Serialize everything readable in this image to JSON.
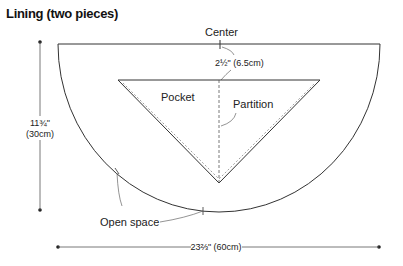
{
  "title": "Lining (two pieces)",
  "labels": {
    "center": "Center",
    "depth": "2½\" (6.5cm)",
    "pocket": "Pocket",
    "partition": "Partition",
    "open_space": "Open space",
    "height_in": "11¾\"",
    "height_cm": "(30cm)",
    "width": "23⅔\" (60cm)"
  },
  "colors": {
    "line": "#333333",
    "dim": "#555555"
  }
}
